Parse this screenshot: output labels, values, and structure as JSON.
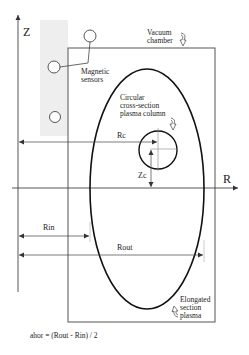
{
  "diagram": {
    "axes": {
      "z_label": "Z",
      "r_label": "R"
    },
    "labels": {
      "vacuum_chamber_line1": "Vacuum",
      "vacuum_chamber_line2": "chamber",
      "magnetic_sensors_line1": "Magnetic",
      "magnetic_sensors_line2": "sensors",
      "circular_line1": "Circular",
      "circular_line2": "cross-section",
      "circular_line3": "plasma column",
      "elongated_line1": "Elongated",
      "elongated_line2": "section",
      "elongated_line3": "plasma",
      "rc": "Rc",
      "zc": "Zc",
      "rin": "Rin",
      "rout": "Rout",
      "formula": "ahor = (Rout - Rin) / 2"
    },
    "colors": {
      "line": "#222222",
      "thin_line": "#555555",
      "shade": "#ececec"
    }
  }
}
